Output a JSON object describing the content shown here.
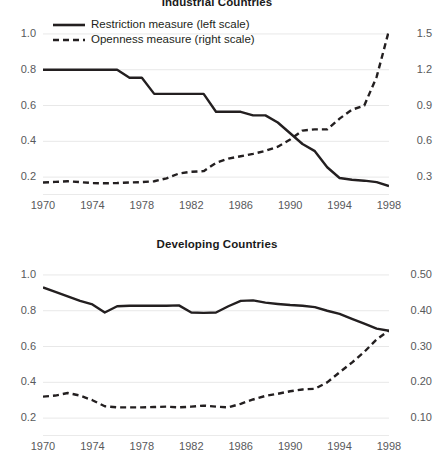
{
  "figure": {
    "legend": {
      "restriction_label": "Restriction measure (left scale)",
      "openness_label": "Openness measure (right scale)",
      "restriction_key_icon": "solid-line-swatch",
      "openness_key_icon": "dashed-line-swatch"
    },
    "line_color": "#231f20",
    "grid_color": "#e8e8e8",
    "axis_color": "#d4d4d4",
    "tick_text_color": "#58595b"
  },
  "chart_data": [
    {
      "type": "line",
      "title": "Industrial Countries",
      "xlabel": "",
      "ylabel": "",
      "grid": true,
      "legend_position": "top-left",
      "x": [
        1970,
        1971,
        1972,
        1973,
        1974,
        1975,
        1976,
        1977,
        1978,
        1979,
        1980,
        1981,
        1982,
        1983,
        1984,
        1985,
        1986,
        1987,
        1988,
        1989,
        1990,
        1991,
        1992,
        1993,
        1994,
        1995,
        1996,
        1997,
        1998
      ],
      "xlim": [
        1970,
        1998
      ],
      "xticks": [
        1970,
        1974,
        1978,
        1982,
        1986,
        1990,
        1994,
        1998
      ],
      "axes": {
        "left": {
          "label": "Restriction measure",
          "ticks": [
            "1.0",
            "0.8",
            "0.6",
            "0.4",
            "0.2"
          ],
          "values": [
            1.0,
            0.8,
            0.6,
            0.4,
            0.2
          ],
          "lim": [
            0.1,
            1.05
          ]
        },
        "right": {
          "label": "Openness measure",
          "ticks": [
            "1.5",
            "1.2",
            "0.9",
            "0.6",
            "0.3"
          ],
          "values": [
            1.5,
            1.2,
            0.9,
            0.6,
            0.3
          ],
          "lim": [
            0.15,
            1.575
          ]
        }
      },
      "series": [
        {
          "name": "Restriction measure (left scale)",
          "style": "solid",
          "axis": "left",
          "values": [
            0.8,
            0.8,
            0.8,
            0.8,
            0.8,
            0.8,
            0.8,
            0.755,
            0.755,
            0.665,
            0.665,
            0.665,
            0.665,
            0.665,
            0.565,
            0.565,
            0.565,
            0.545,
            0.545,
            0.505,
            0.445,
            0.385,
            0.345,
            0.255,
            0.195,
            0.185,
            0.18,
            0.172,
            0.15
          ]
        },
        {
          "name": "Openness measure (right scale)",
          "style": "dashed",
          "axis": "right",
          "values": [
            0.255,
            0.26,
            0.265,
            0.258,
            0.25,
            0.248,
            0.25,
            0.255,
            0.258,
            0.265,
            0.29,
            0.33,
            0.345,
            0.35,
            0.42,
            0.455,
            0.475,
            0.495,
            0.52,
            0.555,
            0.615,
            0.69,
            0.7,
            0.7,
            0.79,
            0.865,
            0.9,
            1.14,
            1.53
          ]
        }
      ]
    },
    {
      "type": "line",
      "title": "Developing Countries",
      "xlabel": "",
      "ylabel": "",
      "grid": true,
      "legend_position": "none",
      "x": [
        1970,
        1971,
        1972,
        1973,
        1974,
        1975,
        1976,
        1977,
        1978,
        1979,
        1980,
        1981,
        1982,
        1983,
        1984,
        1985,
        1986,
        1987,
        1988,
        1989,
        1990,
        1991,
        1992,
        1993,
        1994,
        1995,
        1996,
        1997,
        1998
      ],
      "xlim": [
        1970,
        1998
      ],
      "xticks": [
        1970,
        1974,
        1978,
        1982,
        1986,
        1990,
        1994,
        1998
      ],
      "axes": {
        "left": {
          "label": "Restriction measure",
          "ticks": [
            "1.0",
            "0.8",
            "0.6",
            "0.4",
            "0.2"
          ],
          "values": [
            1.0,
            0.8,
            0.6,
            0.4,
            0.2
          ],
          "lim": [
            0.1,
            1.05
          ]
        },
        "right": {
          "label": "Openness measure",
          "ticks": [
            "0.50",
            "0.40",
            "0.30",
            "0.20",
            "0.10"
          ],
          "values": [
            0.5,
            0.4,
            0.3,
            0.2,
            0.1
          ],
          "lim": [
            0.05,
            0.525
          ]
        }
      },
      "series": [
        {
          "name": "Restriction measure (left scale)",
          "style": "solid",
          "axis": "left",
          "values": [
            0.93,
            0.905,
            0.88,
            0.855,
            0.835,
            0.79,
            0.825,
            0.828,
            0.828,
            0.828,
            0.828,
            0.83,
            0.79,
            0.788,
            0.79,
            0.825,
            0.855,
            0.858,
            0.845,
            0.838,
            0.832,
            0.828,
            0.82,
            0.8,
            0.782,
            0.755,
            0.728,
            0.7,
            0.688
          ]
        },
        {
          "name": "Openness measure (right scale)",
          "style": "dashed",
          "axis": "right",
          "values": [
            0.16,
            0.163,
            0.17,
            0.163,
            0.15,
            0.133,
            0.13,
            0.13,
            0.13,
            0.131,
            0.132,
            0.13,
            0.132,
            0.135,
            0.132,
            0.13,
            0.14,
            0.152,
            0.162,
            0.168,
            0.175,
            0.18,
            0.182,
            0.2,
            0.228,
            0.255,
            0.285,
            0.32,
            0.345
          ]
        }
      ]
    }
  ]
}
